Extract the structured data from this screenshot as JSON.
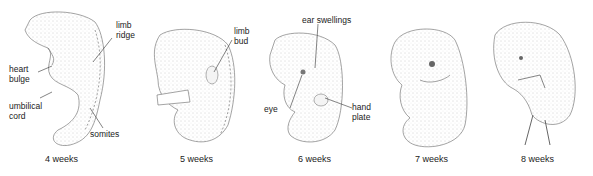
{
  "figure": {
    "stages": [
      {
        "caption": "4 weeks",
        "labels": [
          "limb\nridge",
          "heart\nbulge",
          "umbilical\ncord",
          "somites"
        ]
      },
      {
        "caption": "5 weeks",
        "labels": [
          "limb\nbud"
        ]
      },
      {
        "caption": "6 weeks",
        "labels": [
          "ear swellings",
          "eye",
          "hand\nplate"
        ]
      },
      {
        "caption": "7 weeks",
        "labels": []
      },
      {
        "caption": "8 weeks",
        "labels": []
      }
    ],
    "colors": {
      "stipple": "#8a8a8a",
      "outline": "#555555",
      "text": "#222222"
    }
  }
}
